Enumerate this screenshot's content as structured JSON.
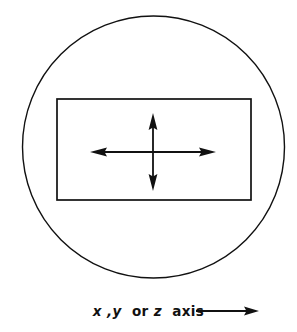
{
  "figure": {
    "background_color": "#ffffff",
    "stroke_color": "#111111",
    "title": "",
    "outer_shape": {
      "name": "circle",
      "cx": 153.5,
      "cy": 147,
      "r": 131,
      "stroke_width": 1.4,
      "fill": "none"
    },
    "inner_shape": {
      "name": "rectangle",
      "x": 57,
      "y": 99,
      "width": 194,
      "height": 101,
      "stroke_width": 1.6,
      "fill": "none"
    },
    "cross_arrows": {
      "name": "four-way-double-arrow",
      "cx": 153,
      "cy": 152,
      "horizontal_x1": 90,
      "horizontal_x2": 216,
      "vertical_y1": 113,
      "vertical_y2": 191,
      "stroke_width": 1.8,
      "arrowhead_length": 16,
      "arrowhead_half_width": 4.5
    }
  },
  "caption": {
    "full_text": "x ,y or z axis",
    "segment_x": "x",
    "segment_comma_y": ",y",
    "segment_or": "or",
    "segment_z": "z",
    "segment_axis": "axis",
    "arrow": {
      "name": "right-arrow",
      "x1": 196,
      "x2": 258,
      "y": 311,
      "stroke_width": 1.8
    }
  }
}
